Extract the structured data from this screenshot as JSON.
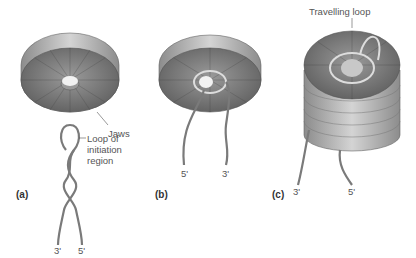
{
  "panels": [
    {
      "id": "a",
      "label": "(a)",
      "end_left": "3'",
      "end_right": "5'",
      "annotations": [
        "Jaws",
        "Loop of",
        "initiation",
        "region"
      ]
    },
    {
      "id": "b",
      "label": "(b)",
      "end_left": "5'",
      "end_right": "3'"
    },
    {
      "id": "c",
      "label": "(c)",
      "end_left": "3'",
      "end_right": "5'",
      "annotations": [
        "Travelling loop"
      ]
    }
  ],
  "colors": {
    "disc_face": "#6e6e6e",
    "disc_face_light": "#a8a8a8",
    "rim": "#cfcfcf",
    "label_text": "#555555",
    "strand": "#8a8a8a"
  }
}
